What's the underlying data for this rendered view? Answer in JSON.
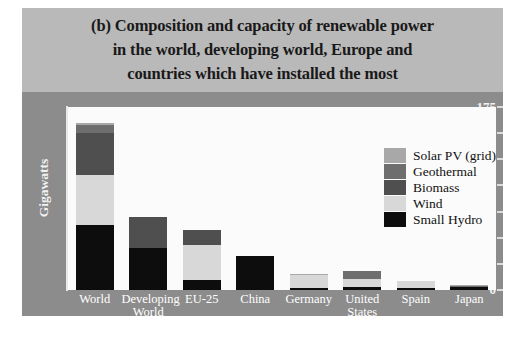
{
  "figure": {
    "panel_label": "(b)",
    "title": "(b) Composition and capacity of renewable power in the world, developing world, Europe and countries which have installed the most",
    "title_line1": "(b) Composition and capacity of renewable power",
    "title_line2": "in the world, developing world, Europe and",
    "title_line3": "countries which have installed the most",
    "background": "#ffffff",
    "title_band_color": "#b9b9b9",
    "panel_color": "#8c8c8c",
    "plot_color": "#fbfbfb"
  },
  "chart_data": {
    "type": "bar",
    "title": "(b) Composition and capacity of renewable power in the world, developing world, Europe and countries which have installed the most",
    "stacked": true,
    "xlabel": "",
    "ylabel": "Gigawatts",
    "ylim": [
      0,
      175
    ],
    "yticks": [
      0,
      25,
      50,
      75,
      100,
      125,
      150,
      175
    ],
    "ytick_labels": [
      "0",
      "25",
      "50",
      "75",
      "100",
      "125",
      "150",
      "175"
    ],
    "grid": false,
    "legend_position": "upper right",
    "categories": [
      "World",
      "Developing World",
      "EU-25",
      "China",
      "Germany",
      "United States",
      "Spain",
      "Japan"
    ],
    "category_labels_line1": [
      "World",
      "Developing",
      "EU-25",
      "China",
      "Germany",
      "United",
      "Spain",
      "Japan"
    ],
    "category_labels_line2": [
      "",
      "World",
      "",
      "",
      "",
      "States",
      "",
      ""
    ],
    "series": [
      {
        "name": "Small Hydro",
        "color": "#0d0d0d",
        "values": [
          62,
          40,
          10,
          33,
          2,
          3,
          2,
          3
        ]
      },
      {
        "name": "Wind",
        "color": "#d8d8d8",
        "values": [
          48,
          0,
          33,
          0,
          12,
          8,
          7,
          0
        ]
      },
      {
        "name": "Biomass",
        "color": "#4f4f4f",
        "values": [
          40,
          30,
          14,
          0,
          0,
          0,
          0,
          0
        ]
      },
      {
        "name": "Geothermal",
        "color": "#6e6e6e",
        "values": [
          8,
          0,
          0,
          0,
          0,
          7,
          0,
          1
        ]
      },
      {
        "name": "Solar PV (grid)",
        "color": "#a8a8a8",
        "values": [
          2,
          0,
          0,
          0,
          1,
          0,
          0,
          1
        ]
      }
    ],
    "totals": [
      160,
      70,
      57,
      33,
      15,
      18,
      9,
      5
    ],
    "legend_entries": [
      {
        "label": "Solar PV (grid)",
        "color": "#a8a8a8"
      },
      {
        "label": "Geothermal",
        "color": "#6e6e6e"
      },
      {
        "label": "Biomass",
        "color": "#4f4f4f"
      },
      {
        "label": "Wind",
        "color": "#d8d8d8"
      },
      {
        "label": "Small Hydro",
        "color": "#0d0d0d"
      }
    ]
  }
}
